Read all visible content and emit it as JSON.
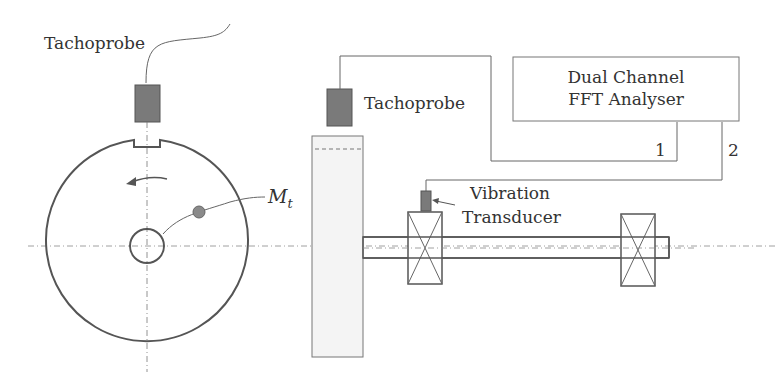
{
  "diagram": {
    "type": "balancing measurement setup schematic",
    "left_view": {
      "tachoprobe_label": "Tachoprobe",
      "mass_label": "M",
      "mass_subscript": "t"
    },
    "right_view": {
      "tachoprobe_label": "Tachoprobe",
      "analyser_line1": "Dual Channel",
      "analyser_line2": "FFT Analyser",
      "channel_1": "1",
      "channel_2": "2",
      "transducer_line1": "Vibration",
      "transducer_line2": "Transducer"
    },
    "colors": {
      "line": "#555555",
      "probe_fill": "#7a7a7a",
      "mass_fill": "#8a8a8a",
      "disc_side_fill": "#f4f4f4"
    }
  }
}
